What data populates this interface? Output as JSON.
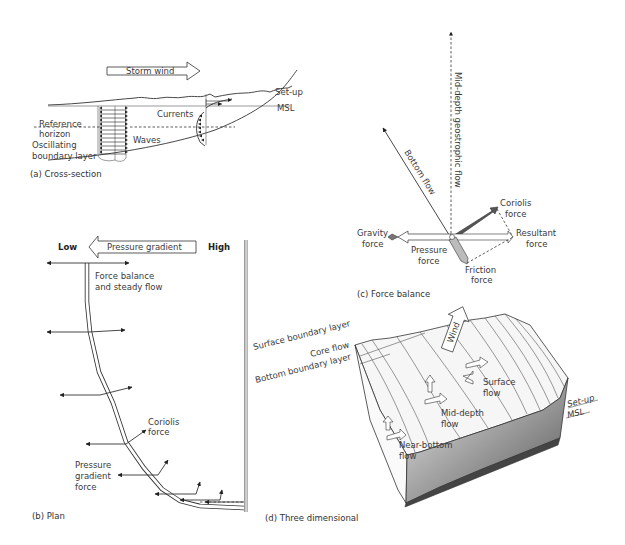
{
  "figure": {
    "panels": [
      {
        "id": "a",
        "caption": "(a)  Cross-section",
        "labels": {
          "storm_wind": "Storm wind",
          "set_up": "Set-up",
          "msl": "MSL",
          "reference_horizon_1": "Reference",
          "reference_horizon_2": "horizon",
          "oscillating_1": "Oscillating",
          "oscillating_2": "boundary layer",
          "waves": "Waves",
          "currents": "Currents"
        }
      },
      {
        "id": "b",
        "caption": "(b)  Plan",
        "labels": {
          "low": "Low",
          "high": "High",
          "pressure_gradient": "Pressure gradient",
          "force_balance_1": "Force balance",
          "force_balance_2": "and steady flow",
          "coriolis_1": "Coriolis",
          "coriolis_2": "force",
          "pgf_1": "Pressure",
          "pgf_2": "gradient",
          "pgf_3": "force"
        }
      },
      {
        "id": "c",
        "caption": "(c)  Force balance",
        "labels": {
          "mid_depth": "Mid-depth geostrophic flow",
          "bottom_flow": "Bottom flow",
          "coriolis_1": "Coriolis",
          "coriolis_2": "force",
          "gravity_1": "Gravity",
          "gravity_2": "force",
          "pressure_1": "Pressure",
          "pressure_2": "force",
          "resultant_1": "Resultant",
          "resultant_2": "force",
          "friction_1": "Friction",
          "friction_2": "force"
        }
      },
      {
        "id": "d",
        "caption": "(d)  Three dimensional",
        "labels": {
          "surface_bl": "Surface boundary layer",
          "core_flow": "Core flow",
          "bottom_bl": "Bottom boundary layer",
          "wind": "Wind",
          "surface_flow_1": "Surface",
          "surface_flow_2": "flow",
          "mid_depth_1": "Mid-depth",
          "mid_depth_2": "flow",
          "near_bottom_1": "Near-bottom",
          "near_bottom_2": "flow",
          "set_up": "Set-up",
          "msl": "MSL"
        }
      }
    ],
    "colors": {
      "ink": "#333333",
      "shade_dark": "#555555",
      "shade_light": "#bbbbbb",
      "wall": "#c8c8c8"
    }
  }
}
